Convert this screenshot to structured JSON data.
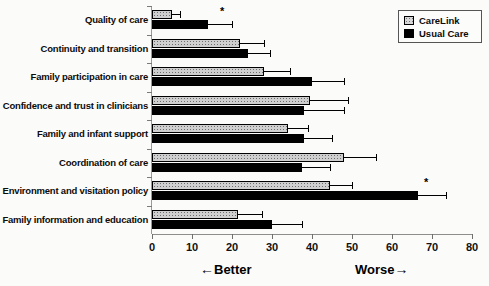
{
  "chart_data": {
    "type": "bar",
    "orientation": "horizontal",
    "title": "",
    "xlabel": "",
    "ylabel": "",
    "xlim": [
      0,
      80
    ],
    "xticks": [
      0,
      10,
      20,
      30,
      40,
      50,
      60,
      70,
      80
    ],
    "grid": false,
    "legend_position": "top-right",
    "categories": [
      "Quality of care",
      "Continuity and transition",
      "Family participation in care",
      "Confidence and trust in clinicians",
      "Family and infant support",
      "Coordination of care",
      "Environment and visitation policy",
      "Family information and education"
    ],
    "series": [
      {
        "name": "CareLink",
        "color": "#d0d0d0",
        "values": [
          5,
          22,
          28,
          39.5,
          34,
          48,
          44.5,
          21.5
        ],
        "errors_upper": [
          7,
          28,
          34.5,
          49,
          39,
          56,
          50,
          27.5
        ]
      },
      {
        "name": "Usual Care",
        "color": "#000000",
        "values": [
          14,
          24,
          40,
          38,
          38,
          37.5,
          66.5,
          30
        ],
        "errors_upper": [
          20,
          29.5,
          48,
          48,
          45,
          44.5,
          73.5,
          37.5
        ]
      }
    ],
    "significance_markers": [
      {
        "category": "Quality of care",
        "symbol": "*",
        "x": 17
      },
      {
        "category": "Environment and visitation policy",
        "symbol": "*",
        "x": 68
      }
    ],
    "annotations": [
      {
        "id": "better",
        "arrow": "←",
        "text": "Better",
        "side": "left"
      },
      {
        "id": "worse",
        "text": "Worse",
        "arrow": "→",
        "side": "right"
      }
    ]
  },
  "legend": {
    "items": [
      {
        "label": "CareLink",
        "swatch": "carelink-swatch"
      },
      {
        "label": "Usual Care",
        "swatch": "usual-care-swatch"
      }
    ]
  },
  "axis": {
    "tick_labels": [
      "0",
      "10",
      "20",
      "30",
      "40",
      "50",
      "60",
      "70",
      "80"
    ]
  }
}
